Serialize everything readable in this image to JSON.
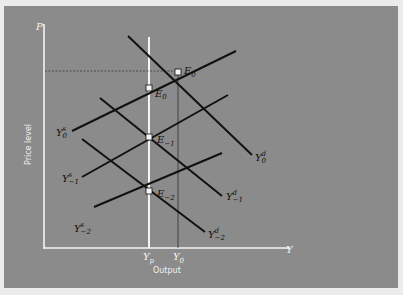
{
  "figure": {
    "axes": {
      "y_axis_symbol": "P",
      "x_axis_symbol": "Y",
      "y_axis_title": "Price level",
      "x_axis_title": "Output",
      "x_ticks": [
        {
          "base": "Y",
          "sub": "p"
        },
        {
          "base": "Y",
          "sub": "0"
        }
      ]
    },
    "supply_curves": [
      {
        "base": "Y",
        "sup": "s",
        "sub": "0"
      },
      {
        "base": "Y",
        "sup": "s",
        "sub": "−1"
      },
      {
        "base": "Y",
        "sup": "s",
        "sub": "−2"
      }
    ],
    "demand_curves": [
      {
        "base": "Y",
        "sup": "d",
        "sub": "0"
      },
      {
        "base": "Y",
        "sup": "d",
        "sub": "−1"
      },
      {
        "base": "Y",
        "sup": "d",
        "sub": "−2"
      }
    ],
    "equilibria": [
      {
        "base": "E",
        "sub": "0"
      },
      {
        "base": "E",
        "sub": "0",
        "prime": "′"
      },
      {
        "base": "E",
        "sub": "−1"
      },
      {
        "base": "E",
        "sub": "−2"
      }
    ]
  },
  "colors": {
    "panel": "#8b8b8b",
    "frame": "#ebebeb",
    "axis": "#f4f4f4",
    "curve": "#111111"
  }
}
